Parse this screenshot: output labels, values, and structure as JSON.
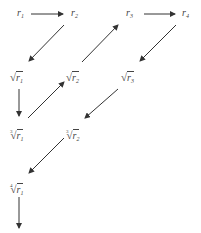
{
  "diagram": {
    "type": "root-extraction flow (Graeffe-style zigzag)",
    "colors": {
      "arrow": "#333333",
      "text": "#444444",
      "background": "#ffffff"
    },
    "nodes": [
      {
        "id": "r1",
        "symbol": "r",
        "subscript": "1",
        "root_index": "",
        "x": 17,
        "y": 8
      },
      {
        "id": "r2",
        "symbol": "r",
        "subscript": "2",
        "root_index": "",
        "x": 71,
        "y": 8
      },
      {
        "id": "r3",
        "symbol": "r",
        "subscript": "3",
        "root_index": "",
        "x": 126,
        "y": 8
      },
      {
        "id": "r4",
        "symbol": "r",
        "subscript": "4",
        "root_index": "",
        "x": 182,
        "y": 8
      },
      {
        "id": "sqrt_r1",
        "symbol": "r",
        "subscript": "1",
        "root_index": "",
        "radical": "√",
        "x": 10,
        "y": 72
      },
      {
        "id": "sqrt_r2",
        "symbol": "r",
        "subscript": "2",
        "root_index": "",
        "radical": "√",
        "x": 66,
        "y": 72
      },
      {
        "id": "sqrt_r3",
        "symbol": "r",
        "subscript": "3",
        "root_index": "",
        "radical": "√",
        "x": 121,
        "y": 72
      },
      {
        "id": "cbrt_r1",
        "symbol": "r",
        "subscript": "1",
        "root_index": "3",
        "radical": "√",
        "x": 10,
        "y": 127
      },
      {
        "id": "cbrt_r2",
        "symbol": "r",
        "subscript": "2",
        "root_index": "3",
        "radical": "√",
        "x": 66,
        "y": 127
      },
      {
        "id": "root4_r1",
        "symbol": "r",
        "subscript": "1",
        "root_index": "4",
        "radical": "√",
        "x": 10,
        "y": 181
      }
    ],
    "edges": [
      {
        "from": "r1",
        "to": "r2"
      },
      {
        "from": "r2",
        "to": "sqrt_r1"
      },
      {
        "from": "sqrt_r1",
        "to": "cbrt_r1"
      },
      {
        "from": "cbrt_r1",
        "to": "sqrt_r2"
      },
      {
        "from": "sqrt_r2",
        "to": "r3"
      },
      {
        "from": "r3",
        "to": "r4"
      },
      {
        "from": "r4",
        "to": "sqrt_r3"
      },
      {
        "from": "sqrt_r3",
        "to": "cbrt_r2"
      },
      {
        "from": "cbrt_r2",
        "to": "root4_r1"
      },
      {
        "from": "root4_r1",
        "to": "continuation"
      }
    ]
  }
}
